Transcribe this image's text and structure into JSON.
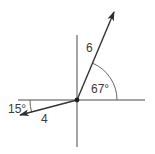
{
  "diagram": {
    "type": "vector-diagram",
    "origin": {
      "x": 77,
      "y": 100
    },
    "axes": {
      "horizontal": {
        "x1": 18,
        "x2": 145,
        "y": 100
      },
      "vertical": {
        "x": 77,
        "y1": 35,
        "y2": 147
      }
    },
    "vectors": [
      {
        "id": "vector-a",
        "magnitude_label": "6",
        "angle_label": "67°",
        "angle_deg": 67,
        "reference": "positive x-axis",
        "tip": {
          "x": 114,
          "y": 12
        },
        "color": "#333333"
      },
      {
        "id": "vector-b",
        "magnitude_label": "4",
        "angle_label": "15°",
        "angle_deg": 15,
        "reference": "negative x-axis, below",
        "tip": {
          "x": 20,
          "y": 115
        },
        "color": "#333333"
      }
    ],
    "labels": {
      "magnitude_a": "6",
      "angle_a": "67°",
      "magnitude_b": "4",
      "angle_b": "15°"
    }
  }
}
